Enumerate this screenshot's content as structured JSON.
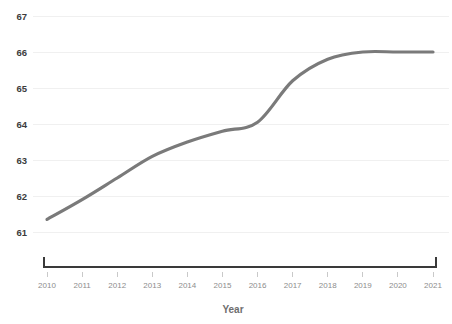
{
  "chart_data": {
    "type": "line",
    "title": "",
    "subtitle": "",
    "xlabel": "Year",
    "ylabel": "",
    "categories": [
      "2010",
      "2011",
      "2012",
      "2013",
      "2014",
      "2015",
      "2016",
      "2017",
      "2018",
      "2019",
      "2020",
      "2021"
    ],
    "x": [
      2010,
      2011,
      2012,
      2013,
      2014,
      2015,
      2016,
      2017,
      2018,
      2019,
      2020,
      2021
    ],
    "values": [
      61.35,
      61.9,
      62.5,
      63.1,
      63.5,
      63.8,
      64.05,
      65.2,
      65.8,
      66.0,
      66.0,
      66.0
    ],
    "series": [
      {
        "name": "",
        "values": [
          61.35,
          61.9,
          62.5,
          63.1,
          63.5,
          63.8,
          64.05,
          65.2,
          65.8,
          66.0,
          66.0,
          66.0
        ]
      }
    ],
    "ylim": [
      60.55,
      67.45
    ],
    "xlim": [
      2010,
      2021
    ],
    "yticks": [
      61,
      62,
      63,
      64,
      65,
      66,
      67
    ],
    "ytick_labels": [
      "61",
      "62",
      "63",
      "64",
      "65",
      "66",
      "67"
    ],
    "xticks": [
      2010,
      2011,
      2012,
      2013,
      2014,
      2015,
      2016,
      2017,
      2018,
      2019,
      2020,
      2021
    ],
    "xtick_labels": [
      "2010",
      "2011",
      "2012",
      "2013",
      "2014",
      "2015",
      "2016",
      "2017",
      "2018",
      "2019",
      "2020",
      "2021"
    ],
    "grid": true,
    "grid_axis": "y",
    "legend": false,
    "legend_position": "none",
    "line_color": "#7a7a7a",
    "grid_color": "#f0f0f0",
    "axis_color": "#3a3a3a",
    "ytick_color": "#3c3c3c",
    "xtick_color": "#8d8d8d",
    "axis_title_color": "#6e6e6e",
    "background_color": "#ffffff",
    "annotations": []
  },
  "axis": {
    "x_title": "Year"
  }
}
